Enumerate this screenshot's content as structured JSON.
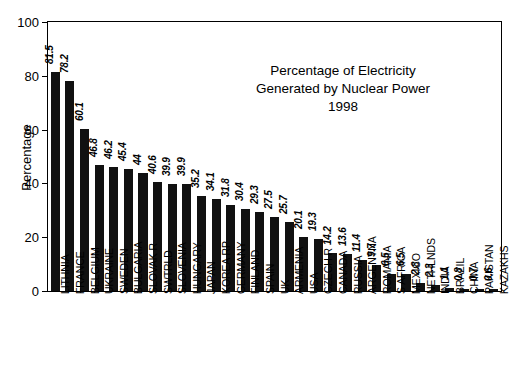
{
  "chart_data": {
    "type": "bar",
    "title": "Percentage of Electricity Generated by Nuclear Power 1998",
    "title_lines": [
      "Percentage of Electricity",
      "Generated by Nuclear Power",
      "1998"
    ],
    "xlabel": "",
    "ylabel": "Percentage",
    "ylim": [
      0,
      100
    ],
    "yticks": [
      0,
      20,
      40,
      60,
      80,
      100
    ],
    "grid": false,
    "legend": "none",
    "bar_color": "#111111",
    "axis_color": "#000000",
    "value_labels_shown": true,
    "categories": [
      "LITHNIA",
      "FRANCE",
      "BELGIUM",
      "UKRAINE",
      "SWEDEN",
      "BULGARIA",
      "SLOVAK R",
      "SWTRLD",
      "SLOVENIA",
      "HUNGARY",
      "JAPAN",
      "KOREA RP",
      "GERMANY",
      "FINLAND",
      "SPAIN",
      "UK",
      "ARMENIA",
      "USA",
      "CZECH R",
      "CANADA",
      "RUSSIA",
      "ARGENTNA",
      "ROMANIA",
      "S AFRICA",
      "MEXICO",
      "NETHLNDS",
      "INDIA",
      "BRAZIL",
      "CHINA",
      "PAKISTAN",
      "KAZAKHS"
    ],
    "values": [
      81.5,
      78.2,
      60.1,
      46.8,
      46.2,
      45.4,
      44,
      40.6,
      39.9,
      39.9,
      35.2,
      34.1,
      31.8,
      30.4,
      29.3,
      27.5,
      25.7,
      20.1,
      19.3,
      14.2,
      13.6,
      11.4,
      9.7,
      6.5,
      6.5,
      2.8,
      2.3,
      1.1,
      0.8,
      0.7,
      0.6
    ],
    "value_label_text": [
      "81.5",
      "78.2",
      "60.1",
      "46.8",
      "46.2",
      "45.4",
      "44",
      "40.6",
      "39.9",
      "39.9",
      "35.2",
      "34.1",
      "31.8",
      "30.4",
      "29.3",
      "27.5",
      "25.7",
      "20.1",
      "19.3",
      "14.2",
      "13.6",
      "11.4",
      "9.7",
      "6.5",
      "6.5",
      "2.8",
      "2.3",
      "1.1",
      "0.8",
      "0.7",
      "0.6"
    ],
    "ytick_labels": [
      "0",
      "20",
      "40",
      "60",
      "80",
      "100"
    ]
  }
}
